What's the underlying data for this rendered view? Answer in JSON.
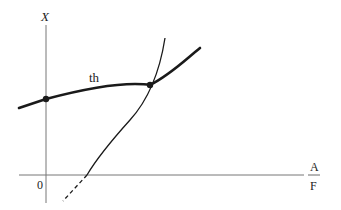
{
  "diagram": {
    "axes": {
      "y_label": "X",
      "origin_label": "0",
      "x_label_numerator": "A",
      "x_label_denominator": "F"
    },
    "curves": [
      {
        "name": "th",
        "label": "th",
        "style": "bold solid"
      },
      {
        "name": "steep-curve",
        "label": "",
        "style": "thin solid with dashed extension below x-axis"
      }
    ],
    "points": [
      {
        "name": "y-intercept-point",
        "on": "th curve at y-axis"
      },
      {
        "name": "intersection-point",
        "on": "intersection of th curve and steep curve"
      }
    ],
    "colors": {
      "axis": "#777777",
      "curve": "#1a1a1a",
      "text": "#222222",
      "background": "#ffffff"
    }
  }
}
